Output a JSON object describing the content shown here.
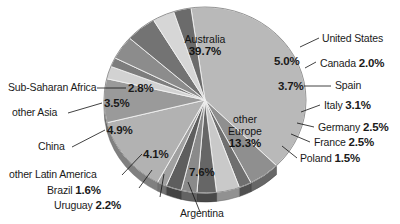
{
  "chart_data": {
    "type": "pie",
    "title": "",
    "subtitle": "",
    "xlabel": "",
    "ylabel": "",
    "legend_position": "callout-labels",
    "grid": false,
    "units": "percent",
    "categories": [
      "Australia",
      "United States",
      "Canada",
      "Spain",
      "Italy",
      "Germany",
      "France",
      "Poland",
      "other Europe",
      "Argentina",
      "Uruguay",
      "Brazil",
      "other Latin America",
      "China",
      "other Asia",
      "Sub-Saharan Africa"
    ],
    "values": [
      39.7,
      5.0,
      2.0,
      3.7,
      3.1,
      2.5,
      2.5,
      1.5,
      13.3,
      7.6,
      2.2,
      1.6,
      4.1,
      4.9,
      3.5,
      2.8
    ],
    "value_labels": [
      "39.7%",
      "5.0%",
      "2.0%",
      "3.7%",
      "3.1%",
      "2.5%",
      "2.5%",
      "1.5%",
      "13.3%",
      "7.6%",
      "2.2%",
      "1.6%",
      "4.1%",
      "4.9%",
      "3.5%",
      "2.8%"
    ],
    "slice_colors": [
      "#b9b9b9",
      "#8f8f8f",
      "#6f6f6f",
      "#c9c9c9",
      "#666666",
      "#8a8a8a",
      "#5e5e5e",
      "#a0a0a0",
      "#b2b2b2",
      "#9a9a9a",
      "#d2d2d2",
      "#7d7d7d",
      "#8c8c8c",
      "#737373",
      "#d6d6d6",
      "#6b6b6b"
    ],
    "start_angle_deg": -8,
    "direction": "clockwise"
  },
  "slices": {
    "australia": {
      "name": "Australia",
      "pct": "39.7%"
    },
    "united_states": {
      "name": "United States",
      "pct": "5.0%"
    },
    "canada": {
      "name": "Canada",
      "pct": "2.0%"
    },
    "spain": {
      "name": "Spain",
      "pct": "3.7%"
    },
    "italy": {
      "name": "Italy",
      "pct": "3.1%"
    },
    "germany": {
      "name": "Germany",
      "pct": "2.5%"
    },
    "france": {
      "name": "France",
      "pct": "2.5%"
    },
    "poland": {
      "name": "Poland",
      "pct": "1.5%"
    },
    "other_europe": {
      "name1": "other",
      "name2": "Europe",
      "pct": "13.3%"
    },
    "argentina": {
      "name": "Argentina",
      "pct": "7.6%"
    },
    "uruguay": {
      "name": "Uruguay",
      "pct": "2.2%"
    },
    "brazil": {
      "name": "Brazil",
      "pct": "1.6%"
    },
    "other_latin_america": {
      "name": "other Latin America",
      "pct": "4.1%"
    },
    "china": {
      "name": "China",
      "pct": "4.9%"
    },
    "other_asia": {
      "name": "other Asia",
      "pct": "3.5%"
    },
    "sub_saharan_africa": {
      "name": "Sub-Saharan Africa",
      "pct": "2.8%"
    }
  }
}
